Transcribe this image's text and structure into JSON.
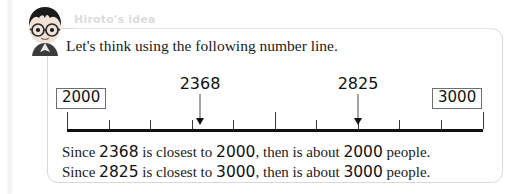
{
  "speaker": {
    "label": "Hiroto's idea",
    "avatar_icon": "boy-with-glasses-avatar-icon"
  },
  "prompt": "Let's think using the following number line.",
  "number_line": {
    "start_label": "2000",
    "end_label": "3000",
    "axis_min": 2000,
    "axis_max": 3000,
    "major_tick_step": 500,
    "minor_tick_step": 100,
    "pointers": [
      {
        "value_label": "2368",
        "value": 2368
      },
      {
        "value_label": "2825",
        "value": 2825
      }
    ]
  },
  "conclusions": [
    {
      "lead": "Since",
      "value": "2368",
      "mid": "is closest to",
      "target": "2000",
      "tail": ", then is about",
      "result": "2000",
      "unit": "people."
    },
    {
      "lead": "Since",
      "value": "2825",
      "mid": "is closest to",
      "target": "3000",
      "tail": ", then is about",
      "result": "3000",
      "unit": "people."
    }
  ],
  "colors": {
    "ink": "#111111",
    "panel_border": "#d8d8d8",
    "label_gray": "#dcdcdc"
  }
}
